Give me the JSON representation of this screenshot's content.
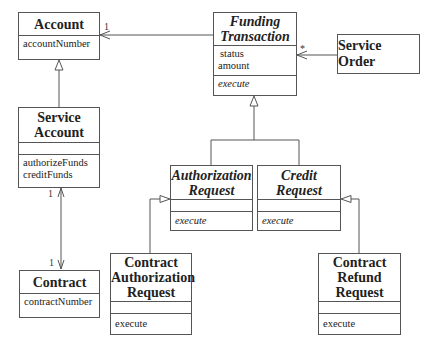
{
  "diagram": {
    "type": "UML class diagram",
    "classes": {
      "account": {
        "name": [
          "Account"
        ],
        "attributes": [
          "accountNumber"
        ],
        "operations": []
      },
      "funding_transaction": {
        "name": [
          "Funding",
          "Transaction"
        ],
        "abstract": true,
        "attributes": [
          "status",
          "amount"
        ],
        "operations": [
          "execute"
        ]
      },
      "service_order": {
        "name": [
          "Service Order"
        ]
      },
      "service_account": {
        "name": [
          "Service",
          "Account"
        ],
        "attributes": [],
        "operations": [
          "authorizeFunds",
          "creditFunds"
        ]
      },
      "contract": {
        "name": [
          "Contract"
        ],
        "attributes": [
          "contractNumber"
        ]
      },
      "authorization_request": {
        "name": [
          "Authorization",
          "Request"
        ],
        "abstract": true,
        "attributes": [],
        "operations": [
          "execute"
        ]
      },
      "credit_request": {
        "name": [
          "Credit",
          "Request"
        ],
        "abstract": true,
        "attributes": [],
        "operations": [
          "execute"
        ]
      },
      "contract_authorization_request": {
        "name": [
          "Contract",
          "Authorization",
          "Request"
        ],
        "attributes": [],
        "operations": [
          "execute"
        ]
      },
      "contract_refund_request": {
        "name": [
          "Contract",
          "Refund",
          "Request"
        ],
        "attributes": [],
        "operations": [
          "execute"
        ]
      }
    },
    "multiplicities": {
      "funding_to_account": "1",
      "service_order_to_funding": "*",
      "service_account_end": "1",
      "contract_end": "1"
    },
    "relationships": [
      {
        "type": "association",
        "from": "Funding Transaction",
        "to": "Account",
        "navigable_to": "Account",
        "multiplicity": "1"
      },
      {
        "type": "association",
        "from": "Service Order",
        "to": "Funding Transaction",
        "navigable_to": "Funding Transaction",
        "multiplicity": "*"
      },
      {
        "type": "generalization",
        "child": "Service Account",
        "parent": "Account"
      },
      {
        "type": "association",
        "from": "Service Account",
        "to": "Contract",
        "bidirectional": true,
        "multiplicity_a": "1",
        "multiplicity_b": "1"
      },
      {
        "type": "generalization",
        "child": "Authorization Request",
        "parent": "Funding Transaction"
      },
      {
        "type": "generalization",
        "child": "Credit Request",
        "parent": "Funding Transaction"
      },
      {
        "type": "generalization",
        "child": "Contract Authorization Request",
        "parent": "Authorization Request"
      },
      {
        "type": "generalization",
        "child": "Contract Refund Request",
        "parent": "Credit Request"
      }
    ]
  }
}
